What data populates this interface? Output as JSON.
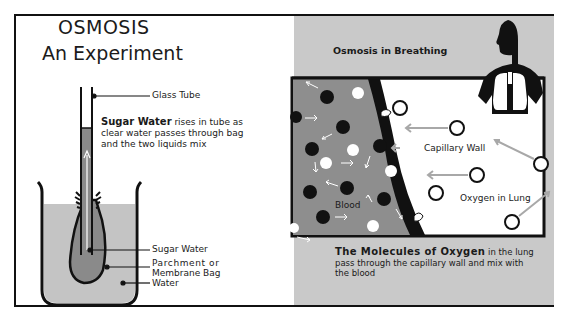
{
  "left_panel": {
    "title_line1": "OSMOSIS",
    "title_line2": "An Experiment",
    "labels": {
      "glass_tube": "Glass Tube",
      "sugar_water": "Sugar Water",
      "bag_line1": "Parchment  or",
      "bag_line2": "Membrane Bag",
      "water": "Water"
    },
    "description": {
      "bold": "Sugar Water",
      "text": " rises in tube as clear water passes through bag and the two liquids mix"
    }
  },
  "right_panel": {
    "title": "Osmosis in Breathing",
    "labels": {
      "capillary_wall": "Capillary Wall",
      "oxygen_in_lung": "Oxygen in Lung",
      "blood": "Blood"
    },
    "caption": {
      "bold": "The Molecules of Oxygen",
      "text": " in the lung pass through the capillary wall and mix with the blood"
    }
  },
  "colors": {
    "ink": "#111111",
    "gray_panel": "#c9c9c9",
    "blood_gray": "#8e8e8e",
    "liquid_gray": "#c4c4c4",
    "bag_gray": "#8a8a8a",
    "arrow_gray": "#a8a8a8"
  }
}
